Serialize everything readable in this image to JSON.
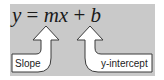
{
  "equation": {
    "y": "y",
    "equals": "=",
    "m": "m",
    "x": "x",
    "plus": "+",
    "b": "b"
  },
  "labels": {
    "slope": "Slope",
    "y_intercept": "y-intercept"
  },
  "colors": {
    "panel": "#c9c9c9",
    "arrow_fill": "#ffffff",
    "arrow_stroke": "#3a3a3a",
    "text": "#1a1a1a"
  }
}
